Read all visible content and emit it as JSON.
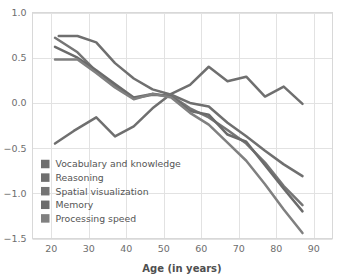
{
  "chart_data": {
    "type": "line",
    "title": "",
    "subtitle": "",
    "xlabel": "Age (in years)",
    "ylabel": "",
    "xlim": [
      15,
      95
    ],
    "ylim": [
      -1.5,
      1.0
    ],
    "xticks": [
      "20",
      "30",
      "40",
      "50",
      "60",
      "70",
      "80",
      "90"
    ],
    "xtick_values": [
      20,
      30,
      40,
      50,
      60,
      70,
      80,
      90
    ],
    "yticks": [
      "1.0",
      "0.5",
      "0.0",
      "−0.5",
      "−1.0",
      "−1.5"
    ],
    "ytick_values": [
      1.0,
      0.5,
      0.0,
      -0.5,
      -1.0,
      -1.5
    ],
    "grid": true,
    "legend_position": "lower-left-inside",
    "series": [
      {
        "name": "Vocabulary and knowledge",
        "color": "#6f6f6f",
        "x": [
          21,
          26,
          32,
          37,
          42,
          47,
          52,
          57,
          62,
          67,
          72,
          77,
          82,
          87
        ],
        "values": [
          -0.45,
          -0.31,
          -0.16,
          -0.37,
          -0.26,
          -0.06,
          0.1,
          0.2,
          0.4,
          0.24,
          0.29,
          0.07,
          0.18,
          -0.01
        ]
      },
      {
        "name": "Reasoning",
        "color": "#6f6f6f",
        "x": [
          22,
          27,
          32,
          37,
          42,
          47,
          52,
          57,
          62,
          67,
          72,
          77,
          82,
          87
        ],
        "values": [
          0.74,
          0.74,
          0.67,
          0.44,
          0.27,
          0.15,
          0.09,
          0.0,
          -0.04,
          -0.22,
          -0.37,
          -0.53,
          -0.68,
          -0.81
        ]
      },
      {
        "name": "Spatial visualization",
        "color": "#757575",
        "x": [
          21,
          27,
          32,
          37,
          42,
          47,
          52,
          57,
          62,
          67,
          72,
          77,
          82,
          87
        ],
        "values": [
          0.72,
          0.56,
          0.35,
          0.19,
          0.05,
          0.09,
          0.08,
          -0.06,
          -0.16,
          -0.3,
          -0.45,
          -0.66,
          -0.92,
          -1.13
        ]
      },
      {
        "name": "Memory",
        "color": "#6b6b6b",
        "x": [
          21,
          27,
          32,
          37,
          42,
          47,
          52,
          57,
          62,
          67,
          72,
          77,
          82,
          87
        ],
        "values": [
          0.62,
          0.5,
          0.36,
          0.21,
          0.06,
          0.1,
          0.07,
          -0.09,
          -0.13,
          -0.35,
          -0.43,
          -0.69,
          -0.95,
          -1.2
        ]
      },
      {
        "name": "Processing speed",
        "color": "#808080",
        "x": [
          21,
          27,
          32,
          37,
          42,
          47,
          52,
          57,
          62,
          67,
          72,
          77,
          82,
          87
        ],
        "values": [
          0.48,
          0.48,
          0.33,
          0.17,
          0.04,
          0.1,
          0.06,
          -0.11,
          -0.24,
          -0.44,
          -0.64,
          -0.9,
          -1.18,
          -1.44
        ]
      }
    ]
  },
  "legend": {
    "items": [
      {
        "label": "Vocabulary and knowledge",
        "swatch": "#6f6f6f"
      },
      {
        "label": "Reasoning",
        "swatch": "#6f6f6f"
      },
      {
        "label": "Spatial visualization",
        "swatch": "#757575"
      },
      {
        "label": "Memory",
        "swatch": "#6b6b6b"
      },
      {
        "label": "Processing speed",
        "swatch": "#808080"
      }
    ]
  },
  "style": {
    "background": "#ffffff",
    "grid_color": "#e2e2e2",
    "frame_color": "#d8d8d8",
    "text_color": "#5a5a5a"
  }
}
